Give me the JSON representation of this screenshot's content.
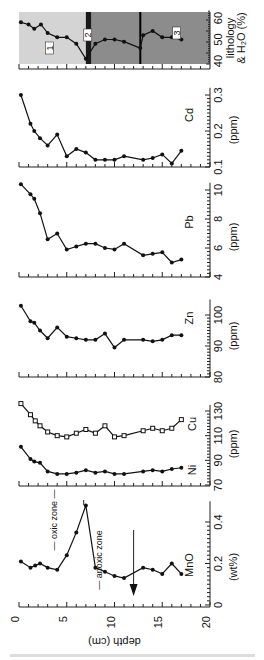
{
  "chart_data": [
    {
      "type": "line",
      "name": "lithology",
      "title": "lithology & H2O (%)",
      "xlabel": "depth (cm)",
      "ylabel": "H2O (%)",
      "ylim": [
        38,
        62
      ],
      "yticks": [
        "40",
        "50",
        "60"
      ],
      "y_pixels": {
        "min_val": 40,
        "min_px": 61,
        "max_val": 60,
        "max_px": 18
      },
      "zones": [
        {
          "label": "1",
          "from": 0,
          "to": 7.0,
          "color": "#d4d4d4"
        },
        {
          "label": "2",
          "from": 7.0,
          "to": 7.6,
          "color": "#1a1a1a"
        },
        {
          "label": "3",
          "from": 7.6,
          "to": 20,
          "color": "#8c8c8c"
        }
      ],
      "divider_depth": 12.7,
      "x": [
        0.2,
        1,
        1.6,
        2.3,
        3,
        4,
        5,
        6,
        7,
        8,
        9,
        10,
        11,
        12.7,
        13,
        14,
        15,
        16,
        17
      ],
      "values": [
        58,
        57,
        55,
        57,
        53,
        51,
        51,
        48,
        41,
        48,
        50,
        50,
        49,
        46,
        52,
        54,
        51,
        51,
        50
      ]
    },
    {
      "type": "line",
      "name": "Cd",
      "ylabel": "Cd",
      "unit": "(ppm)",
      "ylim": [
        0.1,
        0.32
      ],
      "yticks": [
        "0.1",
        "0.2",
        "0.3"
      ],
      "y_pixels": {
        "min_val": 0.1,
        "min_px": 167,
        "max_val": 0.3,
        "max_px": 95
      },
      "x": [
        0.2,
        1.2,
        1.6,
        2.2,
        3,
        4,
        5,
        6,
        7,
        8,
        9,
        10,
        11,
        13,
        14,
        15,
        16,
        17
      ],
      "values": [
        0.3,
        0.22,
        0.2,
        0.18,
        0.16,
        0.19,
        0.13,
        0.15,
        0.14,
        0.12,
        0.12,
        0.12,
        0.13,
        0.12,
        0.125,
        0.135,
        0.11,
        0.145
      ]
    },
    {
      "type": "line",
      "name": "Pb",
      "ylabel": "Pb",
      "unit": "(ppm)",
      "ylim": [
        4,
        10.5
      ],
      "yticks": [
        "4",
        "6",
        "8",
        "10"
      ],
      "y_pixels": {
        "min_val": 4,
        "min_px": 277,
        "max_val": 10,
        "max_px": 190
      },
      "x": [
        0.2,
        1.2,
        1.6,
        2.2,
        3,
        4,
        5,
        6,
        7,
        8,
        9,
        10,
        11,
        13,
        14,
        15,
        16,
        17
      ],
      "values": [
        10.4,
        9.7,
        9.4,
        8.4,
        6.6,
        7.0,
        5.9,
        6.1,
        6.3,
        6.3,
        6.0,
        5.9,
        6.3,
        5.5,
        5.6,
        5.7,
        5.0,
        5.2
      ]
    },
    {
      "type": "line",
      "name": "Zn",
      "ylabel": "Zn",
      "unit": "(ppm)",
      "ylim": [
        80,
        105
      ],
      "yticks": [
        "80",
        "90",
        "100"
      ],
      "y_pixels": {
        "min_val": 80,
        "min_px": 377,
        "max_val": 100,
        "max_px": 315
      },
      "x": [
        0.2,
        1.2,
        1.6,
        2.2,
        3,
        4,
        5,
        6,
        7,
        8,
        9,
        10,
        11,
        13,
        14,
        15,
        16,
        17
      ],
      "values": [
        103,
        98,
        97.5,
        95,
        92.5,
        96,
        93,
        92.5,
        92,
        92,
        94,
        89.5,
        92,
        92,
        91.5,
        92,
        93.5,
        93.5
      ]
    },
    {
      "type": "line",
      "name": "Cu/Ni",
      "unit": "(ppm)",
      "ylim": [
        70,
        135
      ],
      "yticks": [
        "70",
        "90",
        "110",
        "130"
      ],
      "y_pixels": {
        "min_val": 70,
        "min_px": 485,
        "max_val": 130,
        "max_px": 411
      },
      "series": [
        {
          "name": "Cu",
          "marker": "square",
          "x": [
            0.2,
            1.2,
            1.7,
            2.2,
            3,
            4,
            5,
            6,
            7,
            8,
            9,
            10,
            11,
            13,
            14,
            15,
            16,
            17
          ],
          "values": [
            136,
            127,
            122,
            118,
            113,
            110,
            109,
            112,
            115,
            112,
            118,
            109,
            110,
            114,
            116,
            114,
            116,
            123
          ]
        },
        {
          "name": "Ni",
          "marker": "circle",
          "x": [
            0.2,
            1.2,
            1.6,
            2.2,
            3,
            4,
            5,
            6,
            7,
            8,
            9,
            10,
            11,
            13,
            14,
            15,
            16,
            17
          ],
          "values": [
            101,
            91,
            89,
            88,
            81,
            79,
            79,
            80,
            82,
            80,
            81,
            79,
            79,
            81,
            82,
            81,
            83,
            84
          ]
        }
      ]
    },
    {
      "type": "line",
      "name": "MnO",
      "ylabel": "MnO",
      "unit": "(wt%)",
      "ylim": [
        0,
        0.5
      ],
      "yticks": [
        "0",
        "0.2",
        "0.4"
      ],
      "y_pixels": {
        "min_val": 0,
        "min_px": 605,
        "max_val": 0.4,
        "max_px": 522
      },
      "annotations": [
        "oxic zone",
        "anoxic zone"
      ],
      "x": [
        0.2,
        1.2,
        1.7,
        2.2,
        3,
        4,
        5,
        6,
        7,
        8,
        9,
        10,
        11,
        13,
        14,
        15,
        16,
        17
      ],
      "values": [
        0.21,
        0.18,
        0.19,
        0.2,
        0.18,
        0.17,
        0.24,
        0.35,
        0.48,
        0.18,
        0.16,
        0.14,
        0.13,
        0.18,
        0.17,
        0.15,
        0.2,
        0.15
      ]
    }
  ],
  "depth_axis": {
    "label": "depth (cm)",
    "ticks": [
      "0",
      "5",
      "10",
      "15",
      "20"
    ],
    "min": 0,
    "max": 20,
    "px_min": 19,
    "px_max": 210
  },
  "labels": {
    "lithology_line1": "lithology",
    "lithology_line2": "& H₂O (%)",
    "oxic": "oxic zone",
    "anoxic": "anoxic zone",
    "unit_ppm": "(ppm)",
    "unit_wt": "(wt%)"
  }
}
